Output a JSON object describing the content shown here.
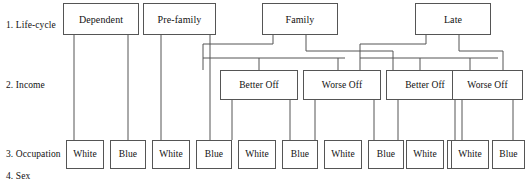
{
  "diagram": {
    "line_color": "#555555",
    "box_fill": "#ffffff",
    "text_color": "#111111"
  },
  "row_labels": [
    {
      "id": "row-label-lifecycle",
      "text": "1. Life-cycle",
      "x": 6,
      "y": 20
    },
    {
      "id": "row-label-income",
      "text": "2. Income",
      "x": 6,
      "y": 80
    },
    {
      "id": "row-label-occupation",
      "text": "3. Occupation",
      "x": 6,
      "y": 149
    },
    {
      "id": "row-label-sex",
      "text": "4. Sex",
      "x": 6,
      "y": 171
    }
  ],
  "levels": {
    "lifecycle": {
      "name": "Life-cycle",
      "nodes": [
        {
          "id": "lifecycle-dependent",
          "label": "Dependent",
          "x": 63,
          "y": 3,
          "w": 76,
          "h": 32
        },
        {
          "id": "lifecycle-prefamily",
          "label": "Pre-family",
          "x": 143,
          "y": 3,
          "w": 73,
          "h": 32
        },
        {
          "id": "lifecycle-family",
          "label": "Family",
          "x": 262,
          "y": 3,
          "w": 76,
          "h": 32
        },
        {
          "id": "lifecycle-late",
          "label": "Late",
          "x": 415,
          "y": 3,
          "w": 76,
          "h": 32
        }
      ]
    },
    "income": {
      "name": "Income",
      "nodes": [
        {
          "id": "income-family-better",
          "label": "Better Off",
          "x": 220,
          "y": 70,
          "w": 78,
          "h": 30
        },
        {
          "id": "income-family-worse",
          "label": "Worse Off",
          "x": 303,
          "y": 70,
          "w": 78,
          "h": 30
        },
        {
          "id": "income-late-better",
          "label": "Better Off",
          "x": 386,
          "y": 70,
          "w": 78,
          "h": 30
        },
        {
          "id": "income-late-worse",
          "label": "Worse Off",
          "x": 452,
          "y": 70,
          "w": 71,
          "h": 30
        }
      ]
    },
    "occupation": {
      "name": "Occupation",
      "nodes": [
        {
          "id": "occupation-1",
          "label": "White",
          "x": 66,
          "y": 140,
          "w": 38,
          "h": 29
        },
        {
          "id": "occupation-2",
          "label": "Blue",
          "x": 110,
          "y": 140,
          "w": 36,
          "h": 29
        },
        {
          "id": "occupation-3",
          "label": "White",
          "x": 152,
          "y": 140,
          "w": 38,
          "h": 29
        },
        {
          "id": "occupation-4",
          "label": "Blue",
          "x": 196,
          "y": 140,
          "w": 36,
          "h": 29
        },
        {
          "id": "occupation-5",
          "label": "White",
          "x": 238,
          "y": 140,
          "w": 38,
          "h": 29
        },
        {
          "id": "occupation-6",
          "label": "Blue",
          "x": 282,
          "y": 140,
          "w": 36,
          "h": 29
        },
        {
          "id": "occupation-7",
          "label": "White",
          "x": 324,
          "y": 140,
          "w": 38,
          "h": 29
        },
        {
          "id": "occupation-8",
          "label": "Blue",
          "x": 368,
          "y": 140,
          "w": 36,
          "h": 29
        },
        {
          "id": "occupation-9",
          "label": "White",
          "x": 406,
          "y": 140,
          "w": 38,
          "h": 29
        },
        {
          "id": "occupation-10",
          "label": "Blue",
          "x": 447,
          "y": 140,
          "w": 33,
          "h": 29
        },
        {
          "id": "occupation-11",
          "label": "White",
          "x": 451,
          "y": 140,
          "w": 38,
          "h": 29
        },
        {
          "id": "occupation-12",
          "label": "Blue",
          "x": 492,
          "y": 140,
          "w": 33,
          "h": 29
        }
      ]
    }
  },
  "connectors": [
    {
      "id": "conn-dependent-white",
      "d": "M 74 35 L 74 140"
    },
    {
      "id": "conn-dependent-blue",
      "d": "M 128 35 L 128 140"
    },
    {
      "id": "conn-prefamily-white",
      "d": "M 161 35 L 161 140"
    },
    {
      "id": "conn-prefamily-blue",
      "d": "M 210 35 L 210 140"
    },
    {
      "id": "conn-family-left-stem",
      "d": "M 273 35 L 273 44 L 203 44 L 203 70"
    },
    {
      "id": "conn-family-right-stem",
      "d": "M 306 35 L 306 51 L 393 51 L 393 70"
    },
    {
      "id": "conn-family-bar",
      "d": "M 203 58 L 345 58"
    },
    {
      "id": "conn-family-better-tap",
      "d": "M 259 58 L 259 70"
    },
    {
      "id": "conn-family-worse-tap",
      "d": "M 338 58 L 338 70"
    },
    {
      "id": "conn-late-left-stem",
      "d": "M 426 35 L 426 44 L 360 44 L 360 70"
    },
    {
      "id": "conn-late-right-stem",
      "d": "M 459 35 L 459 51 L 503 51 L 503 70"
    },
    {
      "id": "conn-late-bar",
      "d": "M 360 58 L 498 58"
    },
    {
      "id": "conn-late-better-tap",
      "d": "M 420 58 L 420 70"
    },
    {
      "id": "conn-late-worse-tap",
      "d": "M 470 58 L 470 70"
    },
    {
      "id": "conn-inc1-white",
      "d": "M 232 100 L 232 140"
    },
    {
      "id": "conn-inc1-blue",
      "d": "M 290 100 L 290 140"
    },
    {
      "id": "conn-inc2-white",
      "d": "M 315 100 L 315 140"
    },
    {
      "id": "conn-inc2-blue",
      "d": "M 374 100 L 374 140"
    },
    {
      "id": "conn-inc3-white",
      "d": "M 398 100 L 398 140"
    },
    {
      "id": "conn-inc3-blue",
      "d": "M 455 100 L 455 140"
    },
    {
      "id": "conn-inc4-white",
      "d": "M 462 100 L 462 140"
    },
    {
      "id": "conn-inc4-blue",
      "d": "M 513 100 L 513 140"
    }
  ]
}
